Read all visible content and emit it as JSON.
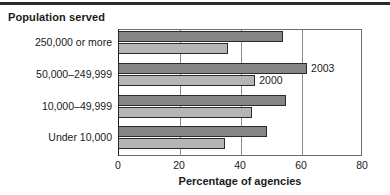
{
  "figure": {
    "group_heading": "Population served",
    "rule": true
  },
  "chart_data": {
    "type": "bar",
    "orientation": "horizontal",
    "title": "",
    "subtitle": "",
    "categories": [
      "250,000 or more",
      "50,000–249,999",
      "10,000–49,999",
      "Under 10,000"
    ],
    "series": [
      {
        "name": "2003",
        "values": [
          54,
          62,
          55,
          49
        ],
        "color": "#858585"
      },
      {
        "name": "2000",
        "values": [
          36,
          45,
          44,
          35
        ],
        "color": "#b5b5b5"
      }
    ],
    "xlabel": "Percentage of agencies",
    "ylabel": "Population served",
    "xlim": [
      0,
      80
    ],
    "xticks": [
      0,
      20,
      40,
      60,
      80
    ],
    "xtick_labels": [
      "0",
      "20",
      "40",
      "60",
      "80"
    ],
    "grid": true,
    "grid_axis": "x",
    "legend": "inline-annotations",
    "annotations": [
      {
        "text": "2003",
        "series": "2003",
        "category": "50,000–249,999"
      },
      {
        "text": "2000",
        "series": "2000",
        "category": "50,000–249,999"
      }
    ]
  }
}
